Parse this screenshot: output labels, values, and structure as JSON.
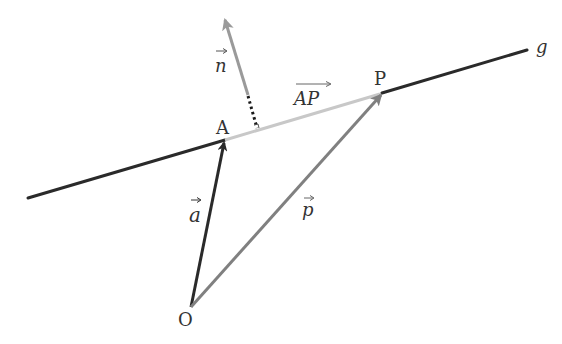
{
  "diagram": {
    "type": "vector-geometry",
    "labels": {
      "line": "g",
      "point_a": "A",
      "point_p": "P",
      "origin": "O",
      "vec_a": "a",
      "vec_p": "p",
      "vec_n": "n",
      "vec_ap": "AP"
    },
    "points": {
      "O": [
        191,
        307
      ],
      "A": [
        225,
        140
      ],
      "P": [
        382,
        93
      ],
      "line_start": [
        28,
        198
      ],
      "line_end": [
        527,
        50
      ],
      "n_tip": [
        224,
        18
      ],
      "n_base": [
        248,
        95
      ],
      "foot": [
        257,
        129
      ]
    },
    "colors": {
      "line": "#2a2a2a",
      "vec_a": "#2a2a2a",
      "vec_p": "#808080",
      "vec_n": "#9a9a9a",
      "vec_ap": "#c8c8c8",
      "label": "#333333"
    }
  }
}
